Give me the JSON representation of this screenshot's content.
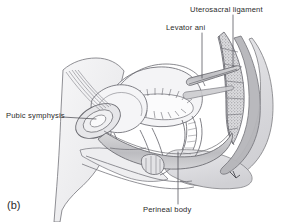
{
  "figure": {
    "panel_letter": "(b)",
    "type": "anatomical-illustration",
    "background_color": "#ffffff",
    "ink_color": "#2b2b2b",
    "line_color": "#6f6f72",
    "muscle_fill": "#c9c9cb",
    "bone_fill": "#b9b9bc",
    "soft_tissue_fill": "#ededef"
  },
  "labels": [
    {
      "id": "uterosacral",
      "text": "Uterosacral ligament",
      "position": "top-right",
      "leader": "vertical line down to uterosacral ligament band"
    },
    {
      "id": "levator",
      "text": "Levator ani",
      "position": "top-center",
      "leader": "vertical line down to levator ani muscle sling"
    },
    {
      "id": "pubic",
      "text": "Pubic symphysis",
      "position": "left",
      "leader": "horizontal line right to pubic symphysis oval"
    },
    {
      "id": "perineal",
      "text": "Perineal body",
      "position": "bottom-center",
      "leader": "vertical line up to perineal body"
    }
  ],
  "structures": [
    "abdominal wall",
    "bladder",
    "pubic symphysis",
    "urethra",
    "uterus",
    "endometrial cavity",
    "vagina",
    "rectum",
    "anal canal",
    "levator ani",
    "uterosacral ligament",
    "perineal body",
    "sacrum",
    "coccyx",
    "gluteal contour"
  ]
}
